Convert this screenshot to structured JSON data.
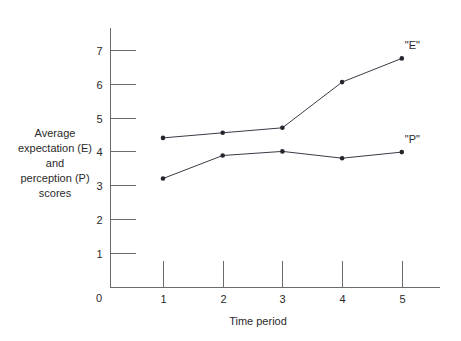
{
  "chart_data": {
    "type": "line",
    "title": "",
    "subtitle": "",
    "xlabel": "Time period",
    "ylabel": "Average expectation (E) and perception (P) scores",
    "x": [
      1,
      2,
      3,
      4,
      5
    ],
    "xticklabels": [
      "1",
      "2",
      "3",
      "4",
      "5"
    ],
    "yticklabels": [
      "1",
      "2",
      "3",
      "4",
      "5",
      "6",
      "7"
    ],
    "yticks": [
      1,
      2,
      3,
      4,
      5,
      6,
      7
    ],
    "origin_label": "0",
    "xlim": [
      0.4,
      5.6
    ],
    "ylim": [
      0,
      7.6
    ],
    "grid": false,
    "legend_position": "inline-right-of-series-end",
    "series": [
      {
        "name": "\"E\"",
        "label": "\"E\"",
        "color": "#3b3b46",
        "marker": "circle",
        "values": [
          4.4,
          4.55,
          4.7,
          6.05,
          6.75
        ]
      },
      {
        "name": "\"P\"",
        "label": "\"P\"",
        "color": "#3b3b46",
        "marker": "circle",
        "values": [
          3.2,
          3.88,
          4.0,
          3.8,
          3.98
        ]
      }
    ]
  },
  "ylabel_lines": [
    "Average",
    "expectation (E)",
    "and",
    "perception (P)",
    "scores"
  ],
  "colors": {
    "axis": "#6b6b6b",
    "series": "#3b3b46",
    "marker": "#25252e",
    "text": "#2a2a2a",
    "background": "#ffffff"
  }
}
